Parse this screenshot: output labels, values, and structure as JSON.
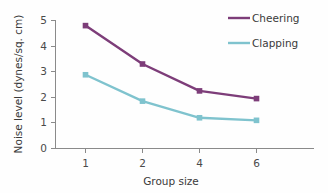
{
  "chart_data": {
    "type": "line",
    "title": "",
    "xlabel": "Group size",
    "ylabel": "Noise level (dynes/sq. cm)",
    "categories": [
      "1",
      "2",
      "4",
      "6"
    ],
    "x_tick_labels": [
      "1",
      "2",
      "4",
      "6"
    ],
    "y_tick_labels": [
      "0",
      "1",
      "2",
      "3",
      "4",
      "5"
    ],
    "ylim": [
      0,
      5
    ],
    "y_ticks": [
      0,
      1,
      2,
      3,
      4,
      5
    ],
    "grid": false,
    "legend_position": "top-right",
    "marker": "square",
    "series": [
      {
        "name": "Cheering",
        "color": "#7d3d79",
        "values": [
          4.8,
          3.3,
          2.25,
          1.95
        ]
      },
      {
        "name": "Clapping",
        "color": "#7fc3ce",
        "values": [
          2.88,
          1.85,
          1.2,
          1.1
        ]
      }
    ]
  },
  "legend": {
    "items": [
      {
        "label": "Cheering",
        "color": "#7d3d79"
      },
      {
        "label": "Clapping",
        "color": "#7fc3ce"
      }
    ]
  },
  "axes": {
    "x_title": "Group size",
    "y_title": "Noise level (dynes/sq. cm)"
  },
  "colors": {
    "cheering": "#7d3d79",
    "clapping": "#7fc3ce",
    "axis": "#8a8a8a",
    "text": "#3a3a3a",
    "background": "#fefefe"
  }
}
